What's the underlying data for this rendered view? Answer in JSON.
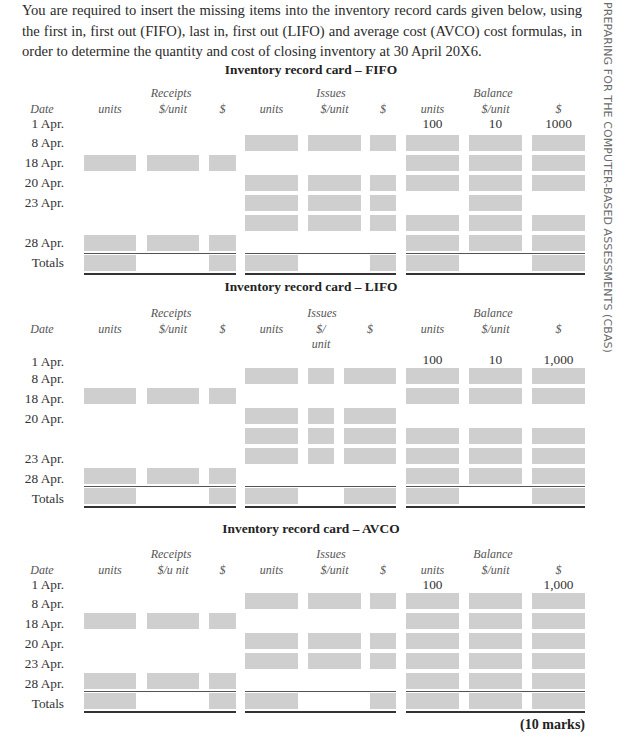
{
  "intro_text": "You are required to insert the missing items into the inventory record cards given below, using the first in, first out (FIFO), last in, first out (LIFO) and average cost (AVCO) cost formulas, in order to determine the quantity and cost of closing inventory at 30 April 20X6.",
  "side_text": "PREPARING FOR THE COMPUTER-BASED ASSESSMENTS (CBAS)",
  "cards": [
    {
      "title": "Inventory record card – FIFO",
      "groups": {
        "receipts": "Receipts",
        "issues": "Issues",
        "balance": "Balance"
      },
      "columns": {
        "date": "Date",
        "r_units": "units",
        "r_unit_cost": "$/unit",
        "r_value": "$",
        "i_units": "units",
        "i_unit_cost": "$/unit",
        "i_value": "$",
        "b_units": "units",
        "b_unit_cost": "$/unit",
        "b_value": "$"
      },
      "rows": [
        "1 Apr.",
        "8 Apr.",
        "18 Apr.",
        "20 Apr.",
        "23 Apr.",
        "28 Apr.",
        "Totals"
      ],
      "opening": {
        "units": "100",
        "unit_cost": "10",
        "value": "1000"
      }
    },
    {
      "title": "Inventory record card – LIFO",
      "groups": {
        "receipts": "Receipts",
        "issues": "Issues",
        "balance": "Balance"
      },
      "columns": {
        "date": "Date",
        "r_units": "units",
        "r_unit_cost": "$/unit",
        "r_value": "$",
        "i_units": "units",
        "i_unit_cost_a": "$/",
        "i_unit_cost_b": "unit",
        "i_value": "$",
        "b_units": "units",
        "b_unit_cost": "$/unit",
        "b_value": "$"
      },
      "rows": [
        "1 Apr.",
        "8 Apr.",
        "18 Apr.",
        "20 Apr.",
        "23 Apr.",
        "28 Apr.",
        "Totals"
      ],
      "opening": {
        "units": "100",
        "unit_cost": "10",
        "value": "1,000"
      }
    },
    {
      "title": "Inventory record card – AVCO",
      "groups": {
        "receipts": "Receipts",
        "issues": "Issues",
        "balance": "Balance"
      },
      "columns": {
        "date": "Date",
        "r_units": "units",
        "r_unit_cost": "$/u nit",
        "r_value": "$",
        "i_units": "units",
        "i_unit_cost": "$/unit",
        "i_value": "$",
        "b_units": "units",
        "b_unit_cost": "$/unit",
        "b_value": "$"
      },
      "rows": [
        "1 Apr.",
        "8 Apr.",
        "18 Apr.",
        "20 Apr.",
        "23 Apr.",
        "28 Apr.",
        "Totals"
      ],
      "opening": {
        "units": "100",
        "unit_cost": "",
        "value": "1,000"
      }
    }
  ],
  "marks": "(10 marks)",
  "colors": {
    "input_cell": "#cfcfcf",
    "rule": "#555555"
  }
}
